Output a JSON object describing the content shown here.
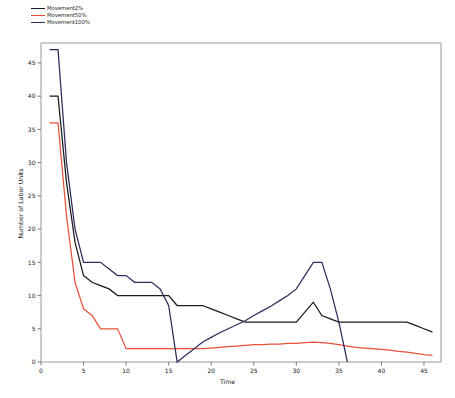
{
  "chart_data": {
    "type": "line",
    "title": "",
    "xlabel": "Time",
    "ylabel": "Number of Labor Units",
    "xlim": [
      0,
      47
    ],
    "ylim": [
      0,
      48
    ],
    "xticks": [
      0,
      5,
      10,
      15,
      20,
      25,
      30,
      35,
      40,
      45
    ],
    "yticks": [
      0,
      5,
      10,
      15,
      20,
      25,
      30,
      35,
      40,
      45
    ],
    "grid": false,
    "legend_position": "top-left-outside",
    "series": [
      {
        "name": "Movement2%",
        "color": "#1c1c1c",
        "x": [
          1,
          2,
          3,
          4,
          5,
          6,
          7,
          8,
          9,
          10,
          11,
          12,
          13,
          14,
          15,
          16,
          17,
          18,
          19,
          20,
          21,
          22,
          23,
          24,
          25,
          26,
          27,
          28,
          29,
          30,
          31,
          32,
          33,
          34,
          35,
          36,
          37,
          38,
          39,
          40,
          41,
          42,
          43,
          44,
          45,
          46
        ],
        "values": [
          40,
          40,
          27,
          18,
          13,
          12,
          11.5,
          11,
          10,
          10,
          10,
          10,
          10,
          10,
          10,
          8.5,
          8.5,
          8.5,
          8.5,
          8,
          7.5,
          7,
          6.5,
          6,
          6,
          6,
          6,
          6,
          6,
          6,
          7.5,
          9,
          7,
          6.5,
          6,
          6,
          6,
          6,
          6,
          6,
          6,
          6,
          6,
          5.5,
          5,
          4.5
        ]
      },
      {
        "name": "Movement50%",
        "color": "#e8503a",
        "x": [
          1,
          2,
          3,
          4,
          5,
          6,
          7,
          8,
          9,
          10,
          11,
          12,
          13,
          14,
          15,
          16,
          17,
          18,
          19,
          20,
          21,
          22,
          23,
          24,
          25,
          26,
          27,
          28,
          29,
          30,
          31,
          32,
          33,
          34,
          35,
          36,
          37,
          38,
          39,
          40,
          41,
          42,
          43,
          44,
          45,
          46
        ],
        "values": [
          36,
          36,
          22,
          12,
          8,
          7,
          5,
          5,
          5,
          2,
          2,
          2,
          2,
          2,
          2,
          2,
          2,
          2,
          2,
          2.1,
          2.2,
          2.3,
          2.4,
          2.5,
          2.6,
          2.6,
          2.7,
          2.7,
          2.8,
          2.8,
          2.9,
          3,
          2.9,
          2.8,
          2.6,
          2.4,
          2.2,
          2.1,
          2,
          1.9,
          1.8,
          1.6,
          1.5,
          1.3,
          1.1,
          1
        ]
      },
      {
        "name": "Movement100%",
        "color": "#2a2f5e",
        "x": [
          1,
          2,
          3,
          4,
          5,
          6,
          7,
          8,
          9,
          10,
          11,
          12,
          13,
          14,
          15,
          16,
          17,
          18,
          19,
          20,
          21,
          22,
          23,
          24,
          25,
          26,
          27,
          28,
          29,
          30,
          31,
          32,
          33,
          34,
          35,
          36
        ],
        "values": [
          47,
          47,
          30,
          20,
          15,
          15,
          15,
          14,
          13,
          13,
          12,
          12,
          12,
          11,
          8.5,
          0,
          1,
          2,
          3,
          3.7,
          4.4,
          5,
          5.6,
          6.2,
          7,
          7.7,
          8.4,
          9.2,
          10,
          11,
          13,
          15,
          15,
          11,
          6,
          0
        ]
      }
    ]
  },
  "legend": {
    "items": [
      {
        "label": "Movement2%",
        "color": "#1c1c1c"
      },
      {
        "label": "Movement50%",
        "color": "#e8503a"
      },
      {
        "label": "Movement100%",
        "color": "#2a2f5e"
      }
    ]
  }
}
